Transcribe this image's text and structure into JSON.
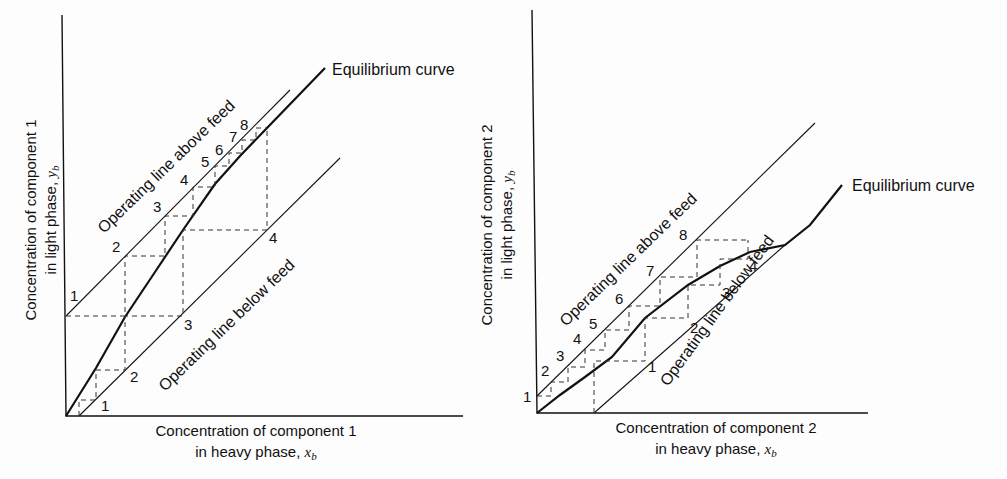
{
  "left": {
    "y_axis_label_line1": "Concentration of component 1",
    "y_axis_label_line2_prefix": "in light phase, ",
    "y_axis_var": "y",
    "y_axis_sub": "b",
    "x_axis_label_line1": "Concentration of component 1",
    "x_axis_label_line2_prefix": "in heavy phase, ",
    "x_axis_var": "x",
    "x_axis_sub": "b",
    "equilibrium_label": "Equilibrium curve",
    "upper_line_label": "Operating line above feed",
    "lower_line_label": "Operating line below feed",
    "upper_stage_numbers": [
      "1",
      "2",
      "3",
      "4",
      "5",
      "6",
      "7",
      "8"
    ],
    "lower_stage_numbers": [
      "1",
      "2",
      "3",
      "4"
    ]
  },
  "right": {
    "y_axis_label_line1": "Concentration of component 2",
    "y_axis_label_line2_prefix": "in light phase, ",
    "y_axis_var": "y",
    "y_axis_sub": "b",
    "x_axis_label_line1": "Concentration of component 2",
    "x_axis_label_line2_prefix": "in heavy phase, ",
    "x_axis_var": "x",
    "x_axis_sub": "b",
    "equilibrium_label": "Equilibrium curve",
    "upper_line_label": "Operating line above feed",
    "lower_line_label": "Operating line below feed",
    "upper_stage_numbers": [
      "1",
      "2",
      "3",
      "4",
      "5",
      "6",
      "7",
      "8"
    ],
    "lower_stage_numbers": [
      "1",
      "2",
      "3",
      "4"
    ]
  },
  "colors": {
    "ink": "#111111",
    "background": "#fdfdfd"
  }
}
